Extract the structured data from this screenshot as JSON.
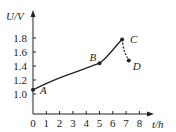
{
  "chart_data": {
    "type": "line",
    "title": "",
    "xlabel": "t/h",
    "ylabel": "U/V",
    "x_ticks": [
      "0",
      "1",
      "2",
      "3",
      "4",
      "5",
      "6",
      "7",
      "8"
    ],
    "y_ticks": [
      "1.0",
      "1.2",
      "1.4",
      "1.6",
      "1.8"
    ],
    "xlim": [
      0,
      8.5
    ],
    "ylim": [
      0.9,
      2.0
    ],
    "grid": false,
    "legend": null,
    "points": [
      {
        "label": "A",
        "x": 0,
        "y": 1.06
      },
      {
        "label": "B",
        "x": 5,
        "y": 1.44
      },
      {
        "label": "C",
        "x": 6.7,
        "y": 1.78
      },
      {
        "label": "D",
        "x": 7.2,
        "y": 1.48
      }
    ],
    "series": [
      {
        "name": "A-B",
        "style": "solid",
        "x": [
          0,
          1,
          2,
          3,
          4,
          5
        ],
        "y": [
          1.06,
          1.15,
          1.23,
          1.3,
          1.37,
          1.44
        ]
      },
      {
        "name": "B-C",
        "style": "solid",
        "x": [
          5,
          5.5,
          6,
          6.4,
          6.7
        ],
        "y": [
          1.44,
          1.52,
          1.63,
          1.72,
          1.78
        ]
      },
      {
        "name": "C-D",
        "style": "dashed",
        "x": [
          6.7,
          6.8,
          7.0,
          7.2
        ],
        "y": [
          1.78,
          1.65,
          1.55,
          1.48
        ]
      }
    ]
  }
}
